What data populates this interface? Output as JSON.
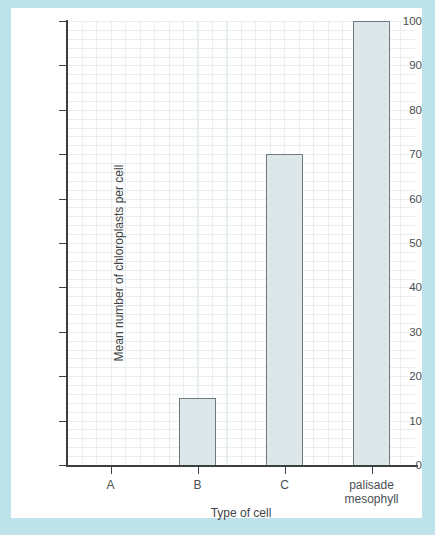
{
  "figure": {
    "background_color": "#bfe3ea",
    "card_color": "#ffffff"
  },
  "chart_data": {
    "type": "bar",
    "title": "",
    "xlabel": "Type of cell",
    "ylabel": "Mean number of chloroplasts per cell",
    "categories": [
      "A",
      "B",
      "C",
      "palisade mesophyll"
    ],
    "values": [
      0,
      15,
      70,
      100
    ],
    "ylim": [
      0,
      100
    ],
    "ytick_labels": [
      "0",
      "10",
      "20",
      "30",
      "40",
      "50",
      "60",
      "70",
      "80",
      "90",
      "100"
    ],
    "ytick_values": [
      0,
      10,
      20,
      30,
      40,
      50,
      60,
      70,
      80,
      90,
      100
    ],
    "grid": "major gridlines every 10 units with fine minor graph-paper grid",
    "legend": "none",
    "bar_fill_color": "#dde6e9",
    "bar_edge_color": "#6f7a7e",
    "axis_color": "#3b3f41",
    "major_grid_color": "#c6d2d6",
    "minor_grid_color": "#e9eef0"
  }
}
